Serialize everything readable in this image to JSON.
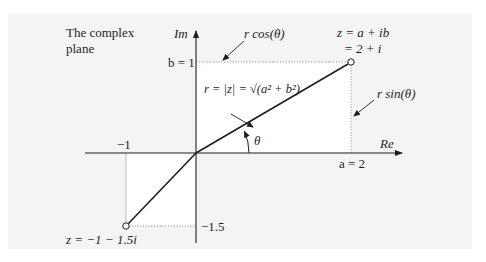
{
  "diagram": {
    "title_line1": "The complex",
    "title_line2": "plane",
    "axes": {
      "imaginary_label": "Im",
      "real_label": "Re"
    },
    "ticks": {
      "b_label": "b = 1",
      "a_label": "a = 2",
      "neg_x_label": "−1",
      "neg_y_label": "−1.5"
    },
    "points": [
      {
        "label_line1": "z = a + ib",
        "label_line2": "= 2 + i",
        "re": 2,
        "im": 1
      },
      {
        "label_line1": "z = −1 − 1.5i",
        "re": -1,
        "im": -1.5
      }
    ],
    "annotations": {
      "r_cos": "r cos(θ)",
      "r_sin": "r sin(θ)",
      "modulus": "r = |z| = √(a² + b²)",
      "theta": "θ"
    },
    "colors": {
      "panel": "#f4f4f4",
      "highlight": "#ffffff",
      "ink": "#1e1e1e",
      "dotted": "#9a9a9a"
    }
  }
}
